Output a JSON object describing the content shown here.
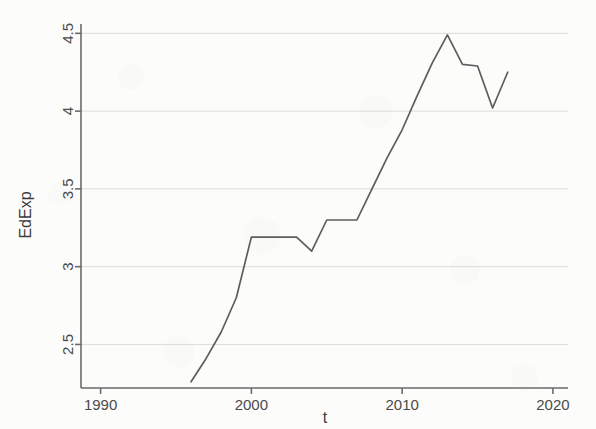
{
  "chart_data": {
    "type": "line",
    "title": "",
    "xlabel": "t",
    "ylabel": "EdExp",
    "xlim": [
      1988.7,
      2021.0
    ],
    "ylim": [
      2.22,
      4.56
    ],
    "grid": true,
    "legend_position": "none",
    "x_ticks": [
      "1990",
      "2000",
      "2010",
      "2020"
    ],
    "x_tick_values": [
      1990,
      2000,
      2010,
      2020
    ],
    "y_ticks": [
      "2.5",
      "3",
      "3.5",
      "4",
      "4.5"
    ],
    "y_tick_values": [
      2.5,
      3,
      3.5,
      4,
      4.5
    ],
    "line_color": "#5d5d5d",
    "grid_color": "#d8d8d6",
    "axis_color": "#6b6b6b",
    "series": [
      {
        "name": "EdExp",
        "x": [
          1996,
          1997,
          1998,
          1999,
          2000,
          2001,
          2002,
          2003,
          2004,
          2005,
          2006,
          2007,
          2008,
          2009,
          2010,
          2011,
          2012,
          2013,
          2014,
          2015,
          2016,
          2017
        ],
        "values": [
          2.26,
          2.41,
          2.58,
          2.8,
          3.19,
          3.19,
          3.19,
          3.19,
          3.1,
          3.3,
          3.3,
          3.3,
          3.5,
          3.7,
          3.88,
          4.1,
          4.31,
          4.49,
          4.3,
          4.29,
          4.02,
          4.25
        ]
      }
    ]
  },
  "figure": {
    "background_color": "#fcfcfb",
    "y_axis_label": "EdExp",
    "x_axis_label": "t"
  }
}
